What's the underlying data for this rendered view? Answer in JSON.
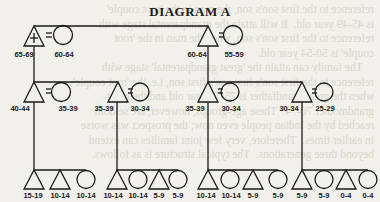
{
  "title": "DIAGRAM A",
  "bleed_text": "reference to the first son's son, the man in the 'root couple'\nis 45-49 year old.  It will attain the grandparental stage with\nreference to the first son's son, when the man in the 'root\ncouple' is 50-54 year old.\n    The family can attain the 'great grandparental' stage with\nreference to the first son's first son's first son, i.e. the 'root couple'\nwhen the great-grandfather is 75-79 year old and the great-\ngrandmother 70-74.  These age-groups, however, are seldom\nreached by the Indian people even now; the prospect was worse\nin earlier times.  Therefore, very few joint families can extend\nbeyond three generations.  The typical structure is as follows.",
  "generation1": [
    {
      "sex": "male",
      "root": true,
      "label": "65-69",
      "spouse_label": "60-64"
    },
    {
      "sex": "male",
      "root": false,
      "label": "60-64",
      "spouse_label": "55-59"
    }
  ],
  "generation2": [
    {
      "label": "40-44",
      "spouse_label": "35-39"
    },
    {
      "label": "35-39",
      "spouse_label": "30-34"
    },
    {
      "label": "35-39",
      "spouse_label": "30-34"
    },
    {
      "label": "30-34",
      "spouse_label": "25-29"
    }
  ],
  "generation3": [
    {
      "group": 1,
      "children": [
        {
          "sex": "male",
          "label": "15-19"
        },
        {
          "sex": "male",
          "label": "10-14"
        },
        {
          "sex": "female",
          "label": "10-14"
        }
      ]
    },
    {
      "group": 2,
      "children": [
        {
          "sex": "male",
          "label": "10-14"
        },
        {
          "sex": "female",
          "label": "10-14"
        },
        {
          "sex": "male",
          "label": "5-9"
        },
        {
          "sex": "female",
          "label": "5-9"
        }
      ]
    },
    {
      "group": 3,
      "children": [
        {
          "sex": "male",
          "label": "10-14"
        },
        {
          "sex": "female",
          "label": "10-14"
        },
        {
          "sex": "male",
          "label": "5-9"
        },
        {
          "sex": "female",
          "label": "5-9"
        }
      ]
    },
    {
      "group": 4,
      "children": [
        {
          "sex": "male",
          "label": "5-9"
        },
        {
          "sex": "female",
          "label": "5-9"
        },
        {
          "sex": "male",
          "label": "0-4"
        },
        {
          "sex": "female",
          "label": "0-4"
        }
      ]
    }
  ],
  "legend": {
    "male_symbol": "triangle",
    "female_symbol": "circle",
    "marriage_symbol": "=",
    "root_marker": "+"
  }
}
